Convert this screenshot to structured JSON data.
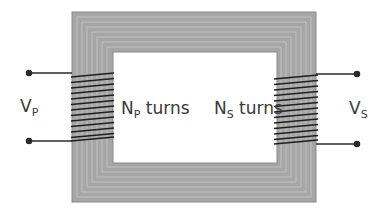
{
  "diagram": {
    "type": "transformer",
    "core_color": "#a6a6a6",
    "core_line_color": "#c8c8c8",
    "core_edge_color": "#8a8a8a",
    "wire_color": "#2a2a2a",
    "primary": {
      "voltage_symbol": "V",
      "voltage_subscript": "P",
      "turns_symbol": "N",
      "turns_subscript": "P",
      "turns_suffix": " turns"
    },
    "secondary": {
      "voltage_symbol": "V",
      "voltage_subscript": "S",
      "turns_symbol": "N",
      "turns_subscript": "S",
      "turns_suffix": " turns"
    }
  }
}
